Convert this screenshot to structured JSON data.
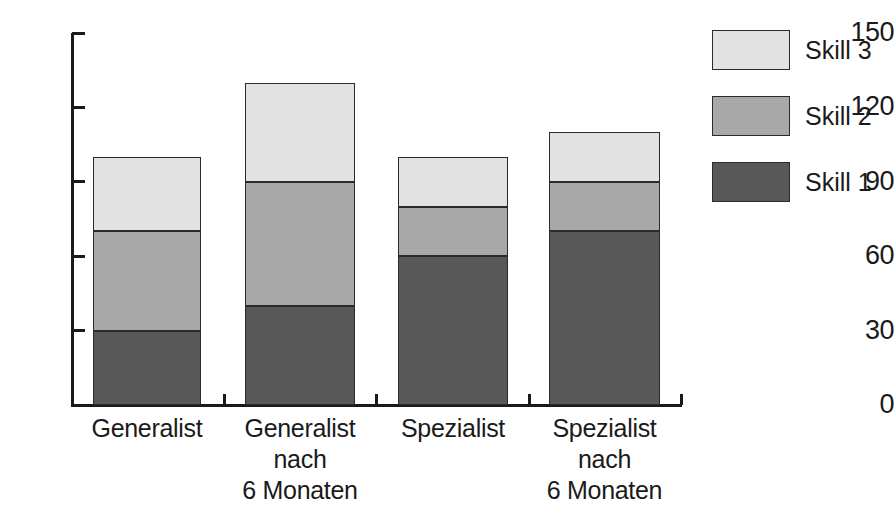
{
  "chart_data": {
    "type": "bar",
    "stacked": true,
    "title": "",
    "xlabel": "",
    "ylabel": "",
    "categories": [
      "Generalist",
      "Generalist nach 6 Monaten",
      "Spezialist",
      "Spezialist nach 6 Monaten"
    ],
    "category_lines": [
      [
        "Generalist"
      ],
      [
        "Generalist",
        "nach",
        "6 Monaten"
      ],
      [
        "Spezialist"
      ],
      [
        "Spezialist",
        "nach",
        "6 Monaten"
      ]
    ],
    "series": [
      {
        "name": "Skill 1",
        "color": "#585858",
        "values": [
          30,
          40,
          60,
          70
        ]
      },
      {
        "name": "Skill 2",
        "color": "#a8a8a8",
        "values": [
          40,
          50,
          20,
          20
        ]
      },
      {
        "name": "Skill 3",
        "color": "#e2e2e2",
        "values": [
          30,
          40,
          20,
          20
        ]
      }
    ],
    "totals": [
      100,
      130,
      100,
      110
    ],
    "ylim": [
      0,
      150
    ],
    "yticks": [
      0,
      30,
      60,
      90,
      120,
      150
    ],
    "ytick_labels": [
      "0",
      "30",
      "60",
      "90",
      "120",
      "150"
    ],
    "grid": false,
    "legend_position": "right",
    "legend_order": [
      "Skill 3",
      "Skill 2",
      "Skill 1"
    ]
  },
  "legend": {
    "items": [
      {
        "label": "Skill 3",
        "color": "#e2e2e2"
      },
      {
        "label": "Skill 2",
        "color": "#a8a8a8"
      },
      {
        "label": "Skill 1",
        "color": "#585858"
      }
    ]
  },
  "colors": {
    "skill_1": "#585858",
    "skill_2": "#a8a8a8",
    "skill_3": "#e2e2e2",
    "axis": "#1a1a1a",
    "background": "#ffffff",
    "bar_border": "#2b2b2b"
  }
}
